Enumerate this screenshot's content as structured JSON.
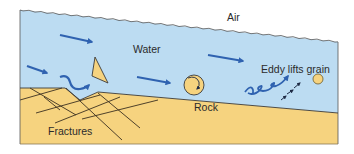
{
  "diagram": {
    "labels": {
      "air": "Air",
      "water": "Water",
      "eddy": "Eddy lifts grain",
      "rock": "Rock",
      "fractures": "Fractures"
    },
    "colors": {
      "water": "#bcdcf2",
      "sediment": "#f6d37f",
      "arrow": "#2f62b0",
      "outline": "#3a3a3a",
      "fracture_line": "#3b3020",
      "text": "#2b2b2b"
    }
  }
}
